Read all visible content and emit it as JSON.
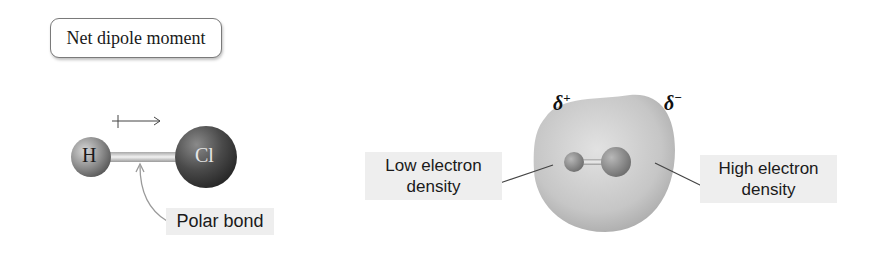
{
  "left_panel": {
    "title": "Net dipole moment",
    "atoms": [
      {
        "symbol": "H",
        "color": "#8a8a8a"
      },
      {
        "symbol": "Cl",
        "color": "#4a4a4a"
      }
    ],
    "dipole_arrow": "crossed arrow pointing right (toward Cl)",
    "callout": "Polar bond"
  },
  "right_panel": {
    "delta_plus": "δ",
    "delta_plus_sign": "+",
    "delta_minus": "δ",
    "delta_minus_sign": "−",
    "left_label_line1": "Low electron",
    "left_label_line2": "density",
    "right_label_line1": "High electron",
    "right_label_line2": "density",
    "cloud_color": "#b8b8b8"
  }
}
